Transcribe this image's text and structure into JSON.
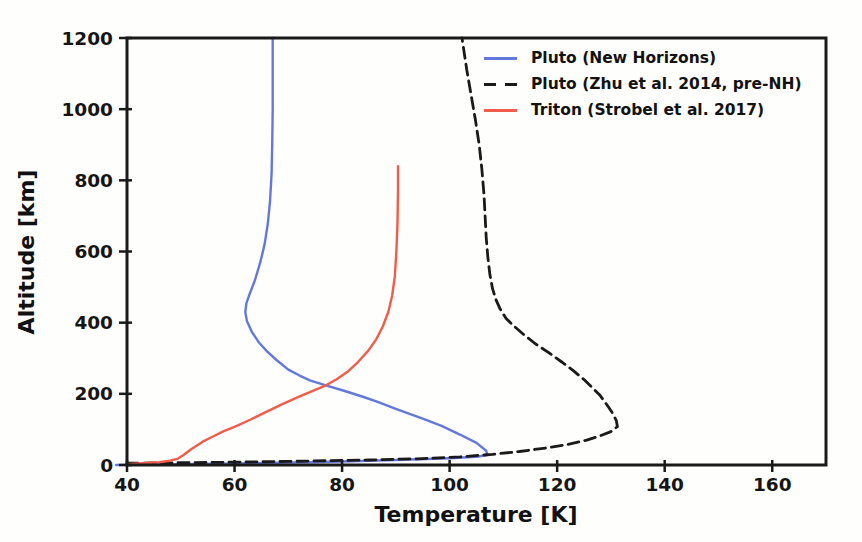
{
  "figure": {
    "background_color": "#fefefd",
    "text_color": "#111111",
    "spine_color": "#1a1a1a"
  },
  "chart_data": {
    "type": "line",
    "title": "",
    "xlabel": "Temperature [K]",
    "ylabel": "Altitude [km]",
    "xlim": [
      40,
      170
    ],
    "ylim": [
      0,
      1200
    ],
    "xticks": [
      40,
      60,
      80,
      100,
      120,
      140,
      160
    ],
    "yticks": [
      0,
      200,
      400,
      600,
      800,
      1000,
      1200
    ],
    "grid": false,
    "legend_position": "upper right",
    "legend_frame": false,
    "series": [
      {
        "name": "Pluto (New Horizons)",
        "color": "#6478dc",
        "style": "solid",
        "points": [
          [
            38,
            0
          ],
          [
            55,
            3
          ],
          [
            75,
            8
          ],
          [
            90,
            14
          ],
          [
            100,
            19
          ],
          [
            105,
            23
          ],
          [
            107,
            28
          ],
          [
            106.8,
            40
          ],
          [
            105,
            62
          ],
          [
            102,
            85
          ],
          [
            98.5,
            110
          ],
          [
            95,
            130
          ],
          [
            90,
            158
          ],
          [
            86.5,
            178
          ],
          [
            84,
            191
          ],
          [
            80.5,
            208
          ],
          [
            77,
            224
          ],
          [
            74,
            238
          ],
          [
            72,
            252
          ],
          [
            70,
            268
          ],
          [
            67.8,
            295
          ],
          [
            66,
            320
          ],
          [
            64.5,
            345
          ],
          [
            63.2,
            375
          ],
          [
            62.3,
            405
          ],
          [
            62,
            430
          ],
          [
            62.2,
            455
          ],
          [
            62.8,
            480
          ],
          [
            63.8,
            520
          ],
          [
            64.8,
            570
          ],
          [
            65.6,
            620
          ],
          [
            66.2,
            680
          ],
          [
            66.6,
            740
          ],
          [
            66.9,
            820
          ],
          [
            67,
            900
          ],
          [
            67.1,
            1000
          ],
          [
            67.1,
            1100
          ],
          [
            67.1,
            1200
          ]
        ]
      },
      {
        "name": "Pluto (Zhu et al. 2014, pre-NH)",
        "color": "#1a1a1a",
        "style": "dashed",
        "points": [
          [
            40,
            5
          ],
          [
            55,
            7
          ],
          [
            70,
            10
          ],
          [
            85,
            14
          ],
          [
            95,
            18
          ],
          [
            102,
            23
          ],
          [
            108,
            30
          ],
          [
            113,
            38
          ],
          [
            118,
            48
          ],
          [
            122,
            58
          ],
          [
            125.5,
            70
          ],
          [
            128,
            82
          ],
          [
            130,
            94
          ],
          [
            131.2,
            108
          ],
          [
            131,
            125
          ],
          [
            130.2,
            148
          ],
          [
            129.3,
            168
          ],
          [
            128,
            195
          ],
          [
            126.5,
            218
          ],
          [
            125,
            240
          ],
          [
            123,
            265
          ],
          [
            121,
            288
          ],
          [
            118.5,
            315
          ],
          [
            116,
            340
          ],
          [
            113.9,
            365
          ],
          [
            112,
            390
          ],
          [
            110.5,
            412
          ],
          [
            109.4,
            438
          ],
          [
            108.6,
            465
          ],
          [
            108,
            495
          ],
          [
            107.5,
            535
          ],
          [
            107.1,
            585
          ],
          [
            106.8,
            640
          ],
          [
            106.6,
            700
          ],
          [
            106.4,
            760
          ],
          [
            106,
            830
          ],
          [
            105.5,
            900
          ],
          [
            104.8,
            970
          ],
          [
            104,
            1040
          ],
          [
            103.2,
            1110
          ],
          [
            102.3,
            1200
          ]
        ]
      },
      {
        "name": "Triton (Strobel et al. 2017)",
        "color": "#f25c4a",
        "style": "solid",
        "points": [
          [
            40,
            2
          ],
          [
            43,
            5
          ],
          [
            46,
            8
          ],
          [
            48,
            12
          ],
          [
            49.5,
            18
          ],
          [
            50.5,
            28
          ],
          [
            52,
            45
          ],
          [
            54,
            65
          ],
          [
            56,
            80
          ],
          [
            58,
            95
          ],
          [
            60,
            107
          ],
          [
            63,
            128
          ],
          [
            66,
            150
          ],
          [
            69,
            172
          ],
          [
            72,
            192
          ],
          [
            75,
            211
          ],
          [
            77,
            224
          ],
          [
            79,
            241
          ],
          [
            81,
            262
          ],
          [
            83,
            290
          ],
          [
            84.8,
            320
          ],
          [
            86.3,
            352
          ],
          [
            87.6,
            390
          ],
          [
            88.6,
            430
          ],
          [
            89.3,
            475
          ],
          [
            89.8,
            530
          ],
          [
            90.1,
            600
          ],
          [
            90.3,
            680
          ],
          [
            90.4,
            770
          ],
          [
            90.4,
            840
          ]
        ]
      }
    ]
  }
}
